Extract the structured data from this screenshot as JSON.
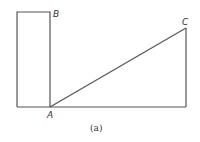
{
  "diagram": {
    "points": {
      "A": {
        "label": "A",
        "x": 50,
        "y": 107
      },
      "B": {
        "label": "B",
        "x": 50,
        "y": 12
      },
      "C": {
        "label": "C",
        "x": 186,
        "y": 28
      }
    },
    "caption": "(a)",
    "stroke_color": "#555555"
  }
}
